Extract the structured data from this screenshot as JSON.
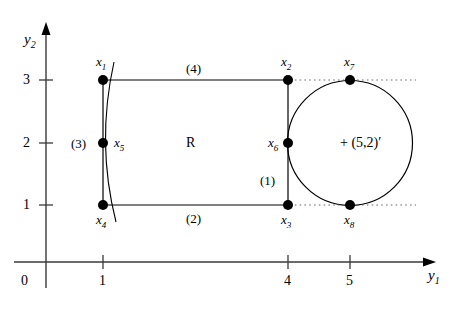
{
  "figure": {
    "type": "geometry-diagram",
    "background_color": "#ffffff",
    "stroke_color": "#000000",
    "width": 462,
    "height": 314
  },
  "axes": {
    "x_axis": {
      "name": "y",
      "subscript": "1",
      "origin_label": "0",
      "ticks": [
        {
          "label": "1",
          "value": 1
        },
        {
          "label": "4",
          "value": 4
        },
        {
          "label": "5",
          "value": 5
        }
      ]
    },
    "y_axis": {
      "name": "y",
      "subscript": "2",
      "ticks": [
        {
          "label": "1",
          "value": 1
        },
        {
          "label": "2",
          "value": 2
        },
        {
          "label": "3",
          "value": 3
        }
      ]
    }
  },
  "region": {
    "label": "R"
  },
  "circle": {
    "center_label": "(5,2)",
    "center_prime": "′",
    "center_marker": "+",
    "center": [
      5,
      2
    ],
    "radius": 1
  },
  "points": [
    {
      "id": "x1",
      "name": "x",
      "subscript": "1",
      "coords": [
        1,
        3
      ]
    },
    {
      "id": "x2",
      "name": "x",
      "subscript": "2",
      "coords": [
        4,
        3
      ]
    },
    {
      "id": "x3",
      "name": "x",
      "subscript": "3",
      "coords": [
        4,
        1
      ]
    },
    {
      "id": "x4",
      "name": "x",
      "subscript": "4",
      "coords": [
        1,
        1
      ]
    },
    {
      "id": "x5",
      "name": "x",
      "subscript": "5",
      "coords": [
        1,
        2
      ]
    },
    {
      "id": "x6",
      "name": "x",
      "subscript": "6",
      "coords": [
        4,
        2
      ]
    },
    {
      "id": "x7",
      "name": "x",
      "subscript": "7",
      "coords": [
        5,
        3
      ]
    },
    {
      "id": "x8",
      "name": "x",
      "subscript": "8",
      "coords": [
        5,
        1
      ]
    }
  ],
  "edges": [
    {
      "id": "e1",
      "label": "(1)"
    },
    {
      "id": "e2",
      "label": "(2)"
    },
    {
      "id": "e3",
      "label": "(3)"
    },
    {
      "id": "e4",
      "label": "(4)"
    }
  ]
}
